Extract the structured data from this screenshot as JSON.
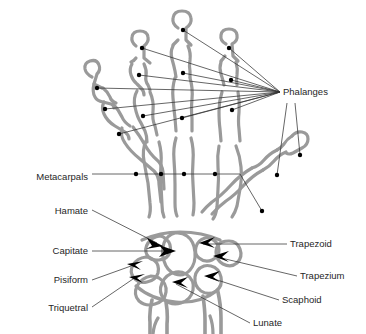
{
  "diagram": {
    "view": "posterior view of hand bones",
    "background_color": "#ffffff",
    "bone_outline_color": "#9a9a9a",
    "leader_line_color": "#333333",
    "marker_color": "#000000",
    "text_color": "#262626"
  },
  "labels": {
    "phalanges": "Phalanges",
    "metacarpals": "Metacarpals",
    "hamate": "Hamate",
    "capitate": "Capitate",
    "pisiform": "Pisiform",
    "triquetral": "Triquetral",
    "trapezoid": "Trapezoid",
    "trapezium": "Trapezium",
    "scaphoid": "Scaphoid",
    "lunate": "Lunate"
  },
  "label_positions": {
    "phalanges": {
      "x": 283,
      "y": 95,
      "align": "start"
    },
    "metacarpals": {
      "x": 88,
      "y": 180,
      "align": "end"
    },
    "hamate": {
      "x": 88,
      "y": 214,
      "align": "end"
    },
    "capitate": {
      "x": 88,
      "y": 254,
      "align": "end"
    },
    "pisiform": {
      "x": 88,
      "y": 283,
      "align": "end"
    },
    "triquetral": {
      "x": 88,
      "y": 311,
      "align": "end"
    },
    "trapezoid": {
      "x": 290,
      "y": 247,
      "align": "start"
    },
    "trapezium": {
      "x": 300,
      "y": 279,
      "align": "start"
    },
    "scaphoid": {
      "x": 282,
      "y": 303,
      "align": "start"
    },
    "lunate": {
      "x": 253,
      "y": 326,
      "align": "start"
    }
  },
  "bone_groups": {
    "phalanges_count": 14,
    "metacarpals_count": 5,
    "carpals_count": 8,
    "carpals_named": [
      "Hamate",
      "Capitate",
      "Pisiform",
      "Triquetral",
      "Trapezoid",
      "Trapezium",
      "Scaphoid",
      "Lunate"
    ]
  }
}
